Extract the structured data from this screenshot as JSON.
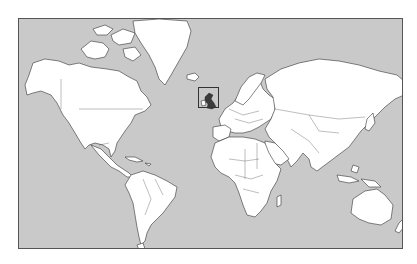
{
  "map": {
    "projection": "Mercator",
    "type": "world political outline map",
    "colors": {
      "ocean": "#c9c9c9",
      "land": "#ffffff",
      "border": "#333333",
      "highlight_fill": "#3a3a3a",
      "highlight_frame": "#333333"
    },
    "highlight": {
      "region": "United Kingdom",
      "label": "United Kingdom"
    }
  }
}
